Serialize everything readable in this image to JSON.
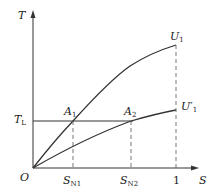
{
  "diagram": {
    "y_axis_label": "T",
    "x_axis_label": "S",
    "origin_label": "O",
    "load_torque": {
      "main": "T",
      "sub": "L"
    },
    "curves": [
      {
        "name": "U1",
        "label_main": "U",
        "label_sub": "1",
        "prime": ""
      },
      {
        "name": "U1_prime",
        "label_main": "U",
        "label_sub": "1",
        "prime": "′"
      }
    ],
    "points": [
      {
        "main": "A",
        "sub": "1"
      },
      {
        "main": "A",
        "sub": "2"
      }
    ],
    "x_ticks": [
      {
        "main": "S",
        "sub": "N1"
      },
      {
        "main": "S",
        "sub": "N2"
      },
      {
        "main": "1",
        "sub": ""
      }
    ],
    "colors": {
      "line": "#333333",
      "dash": "#666666"
    }
  }
}
